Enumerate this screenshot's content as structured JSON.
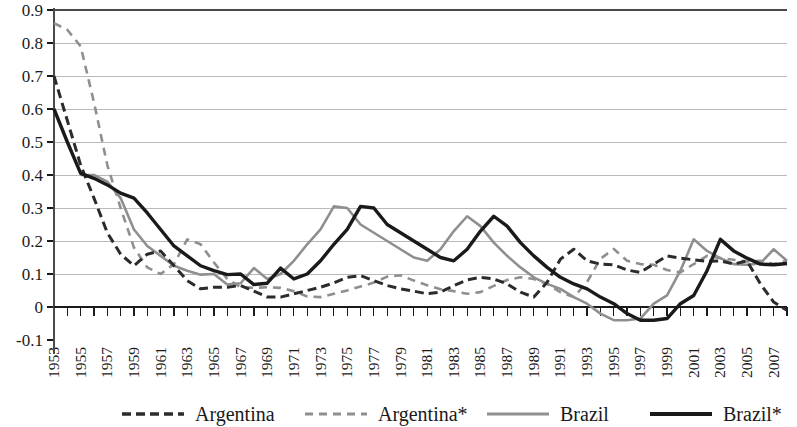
{
  "chart_data": {
    "type": "line",
    "title": "",
    "subtitle": "",
    "xlabel": "",
    "ylabel": "",
    "ylim": [
      -0.1,
      0.9
    ],
    "xlim": [
      1953,
      2008
    ],
    "grid": true,
    "legend_position": "bottom",
    "ytick_labels": [
      "0.9",
      "0.8",
      "0.7",
      "0.6",
      "0.5",
      "0.4",
      "0.3",
      "0.2",
      "0.1",
      "0",
      "-0.1"
    ],
    "ytick_values": [
      0.9,
      0.8,
      0.7,
      0.6,
      0.5,
      0.4,
      0.3,
      0.2,
      0.1,
      0,
      -0.1
    ],
    "x": [
      1953,
      1954,
      1955,
      1956,
      1957,
      1958,
      1959,
      1960,
      1961,
      1962,
      1963,
      1964,
      1965,
      1966,
      1967,
      1968,
      1969,
      1970,
      1971,
      1972,
      1973,
      1974,
      1975,
      1976,
      1977,
      1978,
      1979,
      1980,
      1981,
      1982,
      1983,
      1984,
      1985,
      1986,
      1987,
      1988,
      1989,
      1990,
      1991,
      1992,
      1993,
      1994,
      1995,
      1996,
      1997,
      1998,
      1999,
      2000,
      2001,
      2002,
      2003,
      2004,
      2005,
      2006,
      2007,
      2008
    ],
    "xtick_labels": [
      "1953",
      "1955",
      "1957",
      "1959",
      "1961",
      "1963",
      "1965",
      "1967",
      "1969",
      "1971",
      "1973",
      "1975",
      "1977",
      "1979",
      "1981",
      "1983",
      "1985",
      "1987",
      "1989",
      "1991",
      "1993",
      "1995",
      "1997",
      "1999",
      "2001",
      "2003",
      "2005",
      "2007"
    ],
    "series": [
      {
        "name": "Argentina",
        "style": "dashed",
        "color": "#2b2b2b",
        "width": 3.0,
        "dasharray": "9,5",
        "values": [
          0.7,
          0.565,
          0.43,
          0.33,
          0.225,
          0.16,
          0.125,
          0.16,
          0.17,
          0.125,
          0.08,
          0.055,
          0.06,
          0.06,
          0.065,
          0.048,
          0.03,
          0.03,
          0.04,
          0.05,
          0.06,
          0.073,
          0.09,
          0.095,
          0.08,
          0.065,
          0.055,
          0.048,
          0.04,
          0.045,
          0.065,
          0.082,
          0.09,
          0.085,
          0.07,
          0.045,
          0.03,
          0.075,
          0.145,
          0.175,
          0.14,
          0.13,
          0.128,
          0.112,
          0.105,
          0.13,
          0.155,
          0.148,
          0.143,
          0.138,
          0.14,
          0.13,
          0.14,
          0.07,
          0.015,
          -0.01
        ]
      },
      {
        "name": "Argentina*",
        "style": "dashed",
        "color": "#8f8f8f",
        "width": 2.6,
        "dasharray": "8,6",
        "values": [
          0.86,
          0.84,
          0.79,
          0.62,
          0.43,
          0.3,
          0.18,
          0.12,
          0.1,
          0.13,
          0.205,
          0.19,
          0.135,
          0.085,
          0.06,
          0.058,
          0.06,
          0.058,
          0.048,
          0.032,
          0.03,
          0.04,
          0.05,
          0.062,
          0.074,
          0.092,
          0.096,
          0.08,
          0.066,
          0.054,
          0.048,
          0.04,
          0.045,
          0.064,
          0.082,
          0.09,
          0.085,
          0.07,
          0.045,
          0.03,
          0.076,
          0.146,
          0.176,
          0.14,
          0.13,
          0.128,
          0.112,
          0.105,
          0.13,
          0.155,
          0.148,
          0.143,
          0.138,
          0.14,
          0.13,
          0.14
        ]
      },
      {
        "name": "Brazil",
        "style": "solid",
        "color": "#8f8f8f",
        "width": 2.6,
        "dasharray": "none",
        "values": [
          null,
          null,
          0.4,
          0.4,
          0.38,
          0.33,
          0.235,
          0.185,
          0.155,
          0.125,
          0.11,
          0.098,
          0.1,
          0.068,
          0.072,
          0.118,
          0.085,
          0.1,
          0.14,
          0.19,
          0.235,
          0.305,
          0.3,
          0.25,
          0.225,
          0.2,
          0.175,
          0.15,
          0.14,
          0.175,
          0.23,
          0.275,
          0.245,
          0.195,
          0.155,
          0.12,
          0.09,
          0.07,
          0.055,
          0.03,
          0.01,
          -0.02,
          -0.04,
          -0.04,
          -0.035,
          0.01,
          0.035,
          0.11,
          0.205,
          0.17,
          0.148,
          0.13,
          0.128,
          0.132,
          0.175,
          0.14
        ]
      },
      {
        "name": "Brazil*",
        "style": "solid",
        "color": "#1a1a1a",
        "width": 3.4,
        "dasharray": "none",
        "values": [
          0.6,
          0.5,
          0.405,
          0.39,
          0.37,
          0.345,
          0.33,
          0.285,
          0.235,
          0.185,
          0.155,
          0.125,
          0.11,
          0.098,
          0.1,
          0.068,
          0.072,
          0.118,
          0.085,
          0.1,
          0.14,
          0.19,
          0.235,
          0.305,
          0.3,
          0.25,
          0.225,
          0.2,
          0.175,
          0.15,
          0.14,
          0.175,
          0.23,
          0.275,
          0.245,
          0.195,
          0.155,
          0.12,
          0.09,
          0.07,
          0.055,
          0.03,
          0.01,
          -0.02,
          -0.04,
          -0.04,
          -0.035,
          0.01,
          0.035,
          0.11,
          0.205,
          0.17,
          0.148,
          0.13,
          0.128,
          0.132
        ]
      }
    ]
  },
  "legend": {
    "items": [
      {
        "label": "Argentina",
        "swatch": "dashed-black"
      },
      {
        "label": "Argentina*",
        "swatch": "dashed-gray"
      },
      {
        "label": "Brazil",
        "swatch": "solid-gray"
      },
      {
        "label": "Brazil*",
        "swatch": "solid-black"
      }
    ]
  },
  "colors": {
    "grid": "#b9b9b9",
    "axis": "#4a4a4a",
    "black_series": "#1a1a1a",
    "gray_series": "#8f8f8f",
    "background": "#ffffff"
  }
}
